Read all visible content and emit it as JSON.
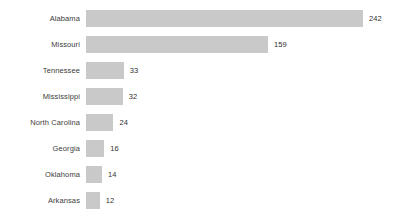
{
  "chart_data": {
    "type": "bar",
    "orientation": "horizontal",
    "title": "",
    "subtitle": "",
    "xlabel": "",
    "ylabel": "",
    "grid": false,
    "legend": null,
    "xlim": [
      0,
      242
    ],
    "bar_color": "#c9c9c9",
    "text_color": "#3c3c3c",
    "background_color": "#ffffff",
    "value_labels_shown": true,
    "axis_line_shown": false,
    "tick_labels_shown": false,
    "categories": [
      "Alabama",
      "Missouri",
      "Tennessee",
      "Mississippi",
      "North Carolina",
      "Georgia",
      "Oklahoma",
      "Arkansas"
    ],
    "values": [
      242,
      159,
      33,
      32,
      24,
      16,
      14,
      12
    ],
    "value_labels": [
      "242",
      "159",
      "33",
      "32",
      "24",
      "16",
      "14",
      "12"
    ],
    "points": [
      {
        "category": "Alabama",
        "value": 242,
        "label": "242"
      },
      {
        "category": "Missouri",
        "value": 159,
        "label": "159"
      },
      {
        "category": "Tennessee",
        "value": 33,
        "label": "33"
      },
      {
        "category": "Mississippi",
        "value": 32,
        "label": "32"
      },
      {
        "category": "North Carolina",
        "value": 24,
        "label": "24"
      },
      {
        "category": "Georgia",
        "value": 16,
        "label": "16"
      },
      {
        "category": "Oklahoma",
        "value": 14,
        "label": "14"
      },
      {
        "category": "Arkansas",
        "value": 12,
        "label": "12"
      }
    ]
  }
}
